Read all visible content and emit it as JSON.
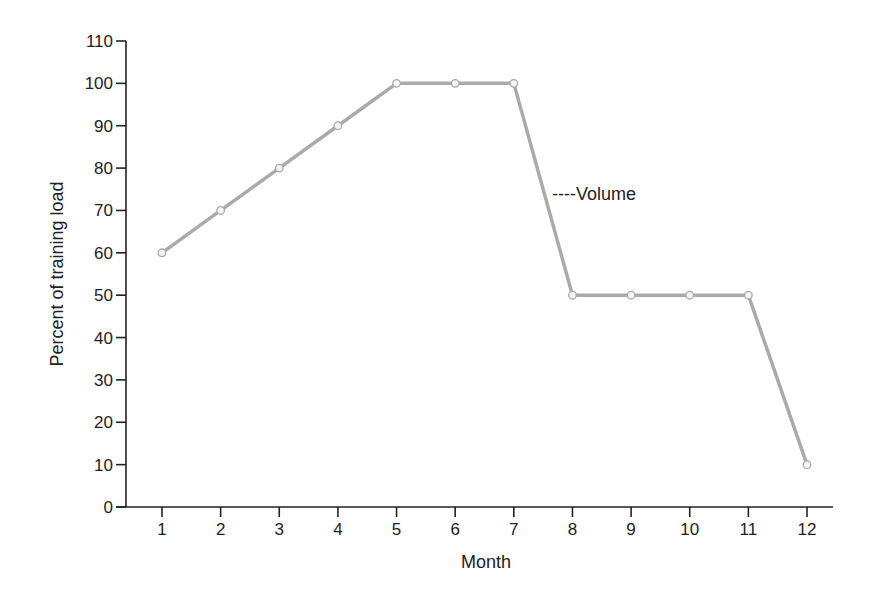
{
  "chart_data": {
    "type": "line",
    "title": "",
    "xlabel": "Month",
    "ylabel": "Percent of training load",
    "categories": [
      "1",
      "2",
      "3",
      "4",
      "5",
      "6",
      "7",
      "8",
      "9",
      "10",
      "11",
      "12"
    ],
    "x": [
      1,
      2,
      3,
      4,
      5,
      6,
      7,
      8,
      9,
      10,
      11,
      12
    ],
    "series": [
      {
        "name": "Volume",
        "values": [
          60,
          70,
          80,
          90,
          100,
          100,
          100,
          50,
          50,
          50,
          50,
          10
        ],
        "color": "#aaaaaa",
        "marker": "open-circle"
      }
    ],
    "ylim": [
      0,
      110
    ],
    "yticks": [
      0,
      10,
      20,
      30,
      40,
      50,
      60,
      70,
      80,
      90,
      100,
      110
    ],
    "xticks": [
      1,
      2,
      3,
      4,
      5,
      6,
      7,
      8,
      9,
      10,
      11,
      12
    ],
    "grid": false,
    "legend": {
      "position": "inside-right",
      "entries": [
        "----Volume"
      ]
    }
  },
  "legend": {
    "label": "----Volume"
  },
  "axes": {
    "xlabel": "Month",
    "ylabel": "Percent of training load"
  }
}
